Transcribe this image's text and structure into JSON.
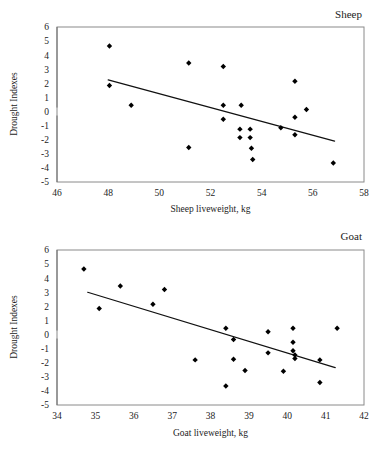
{
  "figure": {
    "background_color": "#ffffff",
    "marker_color": "#000000",
    "trendline_color": "#111111",
    "frame_color": "#8a8a8a"
  },
  "chart_data": [
    {
      "type": "scatter",
      "title": "Sheep",
      "xlabel": "Sheep liveweight, kg",
      "ylabel": "Drought Indexes",
      "xlim": [
        46,
        58
      ],
      "ylim": [
        -5,
        6
      ],
      "xticks": [
        46,
        48,
        50,
        52,
        54,
        56,
        58
      ],
      "yticks": [
        6,
        5,
        4,
        3,
        2,
        1,
        0,
        -1,
        -2,
        -3,
        -4,
        -5
      ],
      "grid": false,
      "legend": "none",
      "marker": "filled-diamond",
      "points": [
        {
          "x": 48.05,
          "y": 4.65
        },
        {
          "x": 48.05,
          "y": 1.85
        },
        {
          "x": 48.9,
          "y": 0.45
        },
        {
          "x": 51.15,
          "y": 3.45
        },
        {
          "x": 51.15,
          "y": -2.55
        },
        {
          "x": 52.5,
          "y": 3.2
        },
        {
          "x": 52.5,
          "y": 0.45
        },
        {
          "x": 52.5,
          "y": -0.55
        },
        {
          "x": 53.15,
          "y": -1.25
        },
        {
          "x": 53.15,
          "y": -1.85
        },
        {
          "x": 53.2,
          "y": 0.45
        },
        {
          "x": 53.55,
          "y": -1.25
        },
        {
          "x": 53.55,
          "y": -1.85
        },
        {
          "x": 53.6,
          "y": -2.6
        },
        {
          "x": 53.65,
          "y": -3.4
        },
        {
          "x": 54.75,
          "y": -1.15
        },
        {
          "x": 55.3,
          "y": 2.15
        },
        {
          "x": 55.3,
          "y": -0.4
        },
        {
          "x": 55.3,
          "y": -1.65
        },
        {
          "x": 55.75,
          "y": 0.15
        },
        {
          "x": 56.8,
          "y": -3.65
        }
      ],
      "trendline": {
        "x1": 48.0,
        "y1": 2.25,
        "x2": 56.85,
        "y2": -2.1
      }
    },
    {
      "type": "scatter",
      "title": "Goat",
      "xlabel": "Goat liveweight, kg",
      "ylabel": "Drought Indexes",
      "xlim": [
        34,
        42
      ],
      "ylim": [
        -5,
        6
      ],
      "xticks": [
        34,
        35,
        36,
        37,
        38,
        39,
        40,
        41,
        42
      ],
      "yticks": [
        6,
        5,
        4,
        3,
        2,
        1,
        0,
        -1,
        -2,
        -3,
        -4,
        -5
      ],
      "grid": false,
      "legend": "none",
      "marker": "filled-diamond",
      "points": [
        {
          "x": 34.7,
          "y": 4.65
        },
        {
          "x": 35.1,
          "y": 1.85
        },
        {
          "x": 35.65,
          "y": 3.45
        },
        {
          "x": 36.5,
          "y": 2.15
        },
        {
          "x": 36.8,
          "y": 3.2
        },
        {
          "x": 37.6,
          "y": -1.8
        },
        {
          "x": 38.4,
          "y": 0.45
        },
        {
          "x": 38.4,
          "y": -3.65
        },
        {
          "x": 38.6,
          "y": -0.35
        },
        {
          "x": 38.6,
          "y": -1.75
        },
        {
          "x": 38.9,
          "y": -2.55
        },
        {
          "x": 39.5,
          "y": 0.2
        },
        {
          "x": 39.5,
          "y": -1.3
        },
        {
          "x": 39.9,
          "y": -2.6
        },
        {
          "x": 40.15,
          "y": 0.45
        },
        {
          "x": 40.15,
          "y": -0.55
        },
        {
          "x": 40.15,
          "y": -1.15
        },
        {
          "x": 40.2,
          "y": -1.45
        },
        {
          "x": 40.2,
          "y": -1.7
        },
        {
          "x": 40.85,
          "y": -1.8
        },
        {
          "x": 40.85,
          "y": -3.4
        },
        {
          "x": 41.3,
          "y": 0.45
        }
      ],
      "trendline": {
        "x1": 34.8,
        "y1": 3.0,
        "x2": 41.25,
        "y2": -2.35
      }
    }
  ]
}
